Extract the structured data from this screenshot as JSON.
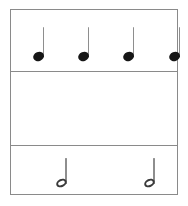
{
  "figure": {
    "frame_color": "#8a8a8a",
    "background_color": "#ffffff",
    "ink_color": "#161616"
  },
  "chart_data": {
    "type": "table",
    "xlabel": "",
    "ylabel": "",
    "grid": true,
    "legend": "none",
    "categories": [
      "Quarter notes",
      "Half notes",
      "Whole note"
    ],
    "values": [
      4,
      2,
      1
    ],
    "series": [
      {
        "name": "Note count per row",
        "values": [
          4,
          2,
          1
        ]
      },
      {
        "name": "Beats per note",
        "values": [
          1,
          2,
          4
        ]
      },
      {
        "name": "Total beats per row",
        "values": [
          4,
          4,
          4
        ]
      }
    ],
    "rows": [
      {
        "id": "row-quarters",
        "note_type": "quarter note",
        "glyph": "filled-notehead-with-stem",
        "count": 4,
        "beats_each": 1,
        "row_total_beats": 4,
        "notehead": "filled",
        "has_stem": true,
        "positions_px": [
          24,
          69,
          114,
          159
        ]
      },
      {
        "id": "row-halves",
        "note_type": "half note",
        "glyph": "hollow-notehead-with-stem",
        "count": 2,
        "beats_each": 2,
        "row_total_beats": 4,
        "notehead": "hollow",
        "has_stem": true,
        "positions_px": [
          46,
          134
        ]
      },
      {
        "id": "row-whole",
        "note_type": "whole note",
        "glyph": "hollow-oval-notehead",
        "count": 1,
        "beats_each": 4,
        "row_total_beats": 4,
        "notehead": "hollow",
        "has_stem": false,
        "positions_px": [
          92
        ]
      }
    ]
  },
  "notes": {
    "quarter": [
      {
        "name": "quarter-note-1"
      },
      {
        "name": "quarter-note-2"
      },
      {
        "name": "quarter-note-3"
      },
      {
        "name": "quarter-note-4"
      }
    ],
    "half": [
      {
        "name": "half-note-1"
      },
      {
        "name": "half-note-2"
      }
    ],
    "whole": [
      {
        "name": "whole-note-1"
      }
    ]
  }
}
